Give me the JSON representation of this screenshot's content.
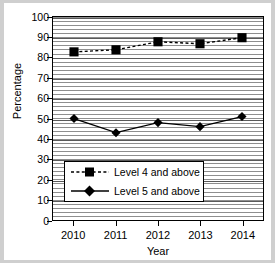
{
  "chart_data": {
    "type": "line",
    "title": "",
    "xlabel": "Year",
    "ylabel": "Percentage",
    "categories": [
      "2010",
      "2011",
      "2012",
      "2013",
      "2014"
    ],
    "ylim": [
      0,
      100
    ],
    "ytick_step": 10,
    "yticks": [
      "100",
      "90",
      "80",
      "70",
      "60",
      "50",
      "40",
      "30",
      "20",
      "10",
      "0"
    ],
    "grid": true,
    "legend_position": "inside-lower-left",
    "series": [
      {
        "name": "Level 4 and above",
        "values": [
          83,
          84,
          88,
          87,
          90
        ],
        "marker": "square",
        "linestyle": "dashed",
        "color": "#000000"
      },
      {
        "name": "Level 5 and above",
        "values": [
          50,
          43,
          48,
          46,
          51
        ],
        "marker": "diamond",
        "linestyle": "solid",
        "color": "#000000"
      }
    ]
  },
  "legend": {
    "entries": [
      {
        "label": "Level 4 and above",
        "symbol": "square-dashed-line"
      },
      {
        "label": "Level 5 and above",
        "symbol": "diamond-solid-line"
      }
    ]
  },
  "colors": {
    "ink": "#000000",
    "gridline": "#8e8e8e",
    "page": "#ffffff",
    "canvas": "#cfcfcf"
  }
}
